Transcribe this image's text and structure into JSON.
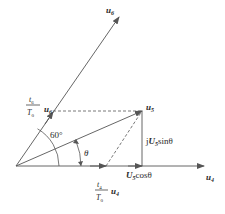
{
  "diagram": {
    "type": "space-vector synthesis diagram",
    "colors": {
      "line": "#555555",
      "text": "#2a2a2a",
      "background": "#ffffff"
    },
    "vectors": {
      "u6": {
        "label": "u",
        "subscript": "6"
      },
      "u4": {
        "label": "u",
        "subscript": "4"
      },
      "u5": {
        "label": "u",
        "subscript": "5"
      }
    },
    "labels": {
      "t6_num": "t",
      "t6_num_sub": "6",
      "t6_den": "T",
      "t6_den_sub": "0",
      "u6_component_vec": "u",
      "u6_component_sub": "6",
      "t4_num": "t",
      "t4_num_sub": "4",
      "t4_den": "T",
      "t4_den_sub": "0",
      "u4_component_vec": "u",
      "u4_component_sub": "4",
      "angle_60": "60°",
      "angle_theta": "θ",
      "jsin_prefix": "j",
      "jsin_U": "U",
      "jsin_sub": "5",
      "jsin_suffix": "sinθ",
      "cos_U": "U",
      "cos_sub": "5",
      "cos_suffix": "cosθ"
    }
  }
}
